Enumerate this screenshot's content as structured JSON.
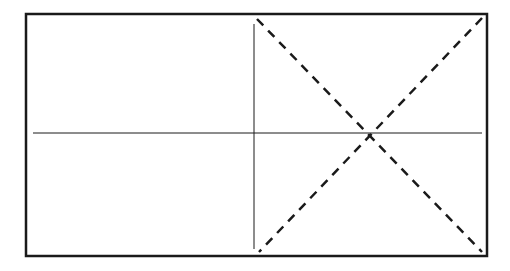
{
  "diagram": {
    "width": 510,
    "height": 271,
    "background": "#ffffff",
    "stroke_color": "#1a1a1a",
    "outer_frame": {
      "x": 26,
      "y": 14,
      "width": 461,
      "height": 242,
      "stroke_width": 2.5
    },
    "solid_lines": [
      {
        "name": "vertical-divider-line",
        "x1": 254,
        "y1": 24,
        "x2": 254,
        "y2": 249,
        "stroke_width": 1
      },
      {
        "name": "horizontal-center-line",
        "x1": 33,
        "y1": 133,
        "x2": 482,
        "y2": 133,
        "stroke_width": 1
      }
    ],
    "dashed_lines": [
      {
        "name": "diagonal-dashed-line-descending",
        "x1": 257,
        "y1": 19,
        "x2": 482,
        "y2": 252,
        "stroke_width": 2.5,
        "dash": "9 7"
      },
      {
        "name": "diagonal-dashed-line-ascending",
        "x1": 482,
        "y1": 18,
        "x2": 259,
        "y2": 252,
        "stroke_width": 2.5,
        "dash": "9 7"
      }
    ]
  }
}
